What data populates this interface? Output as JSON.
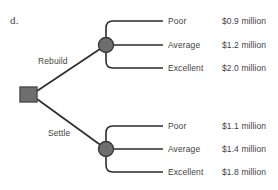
{
  "figure": {
    "part_label": "d.",
    "background_color": "#ffffff",
    "line_color": "#2b2b2b",
    "node_fill": "#6e6e6e",
    "node_stroke": "#3a3a3a",
    "text_color": "#3f3f3f"
  },
  "decision_node": {
    "name": "decision-square",
    "shape": "square",
    "x": 28,
    "y": 94
  },
  "branches": [
    {
      "id": "rebuild",
      "label": "Rebuild",
      "chance_node": {
        "x": 106,
        "y": 45
      },
      "outcomes": [
        {
          "name": "Poor",
          "value": "$0.9 million",
          "y": 21
        },
        {
          "name": "Average",
          "value": "$1.2 million",
          "y": 45
        },
        {
          "name": "Excellent",
          "value": "$2.0 million",
          "y": 68
        }
      ]
    },
    {
      "id": "settle",
      "label": "Settle",
      "chance_node": {
        "x": 106,
        "y": 149
      },
      "outcomes": [
        {
          "name": "Poor",
          "value": "$1.1 million",
          "y": 126
        },
        {
          "name": "Average",
          "value": "$1.4 million",
          "y": 149
        },
        {
          "name": "Excellent",
          "value": "$1.8 million",
          "y": 172
        }
      ]
    }
  ]
}
